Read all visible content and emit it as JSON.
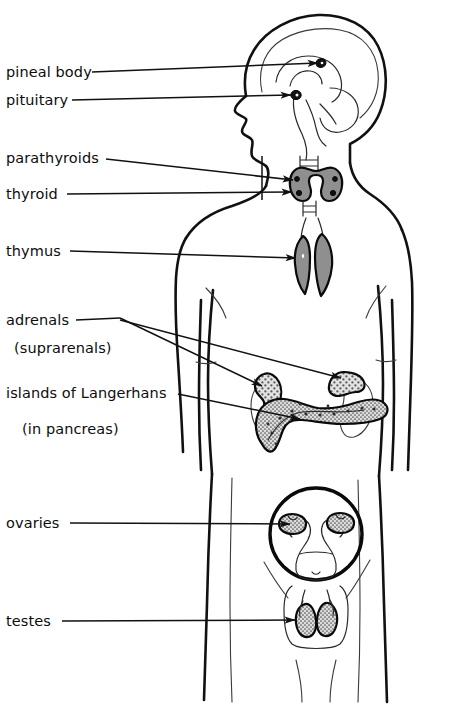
{
  "figure": {
    "background_color": "#ffffff",
    "line_color": "#111111",
    "organ_fill_color": "#8f8f8f",
    "stipple_color": "#6e6e6e"
  },
  "labels": [
    {
      "id": "pineal-body",
      "text": "pineal body",
      "x": 6,
      "y": 77,
      "leader": {
        "x1": 92,
        "y1": 72,
        "x2": 318,
        "y2": 63
      },
      "organ": "pineal body in brain"
    },
    {
      "id": "pituitary",
      "text": "pituitary",
      "x": 6,
      "y": 105,
      "leader": {
        "x1": 72,
        "y1": 100,
        "x2": 293,
        "y2": 95
      },
      "organ": "pituitary gland in brain"
    },
    {
      "id": "parathyroids",
      "text": "parathyroids",
      "x": 6,
      "y": 163,
      "leader": {
        "x1": 106,
        "y1": 159,
        "x2": 293,
        "y2": 179
      },
      "organ": "parathyroid glands on thyroid"
    },
    {
      "id": "thyroid",
      "text": "thyroid",
      "x": 6,
      "y": 199,
      "leader": {
        "x1": 67,
        "y1": 194,
        "x2": 292,
        "y2": 192
      },
      "organ": "thyroid gland in neck"
    },
    {
      "id": "thymus",
      "text": "thymus",
      "x": 6,
      "y": 256,
      "leader": {
        "x1": 70,
        "y1": 251,
        "x2": 295,
        "y2": 247
      },
      "organ": "thymus in upper chest"
    },
    {
      "id": "adrenals",
      "text": "adrenals",
      "x": 6,
      "y": 325,
      "sublabel": "(suprarenals)",
      "sublabel_x": 14,
      "sublabel_y": 353,
      "leader": {
        "x1": 76,
        "y1": 320,
        "x2": 120,
        "y2": 318
      },
      "organ": "adrenal glands on kidneys"
    },
    {
      "id": "islands-of-langerhans",
      "text": "islands of Langerhans",
      "x": 6,
      "y": 398,
      "sublabel": "(in pancreas)",
      "sublabel_x": 22,
      "sublabel_y": 434,
      "leader": {
        "x1": 178,
        "y1": 394,
        "x2": 302,
        "y2": 402
      },
      "organ": "pancreatic islets"
    },
    {
      "id": "ovaries",
      "text": "ovaries",
      "x": 6,
      "y": 528,
      "leader": {
        "x1": 70,
        "y1": 523,
        "x2": 296,
        "y2": 523
      },
      "organ": "ovaries in female reproductive inset"
    },
    {
      "id": "testes",
      "text": "testes",
      "x": 6,
      "y": 626,
      "leader": {
        "x1": 62,
        "y1": 621,
        "x2": 296,
        "y2": 621
      },
      "organ": "testes in scrotum inset"
    }
  ],
  "organs": [
    {
      "id": "pineal-body",
      "name": "pineal body",
      "style": "solid-dark"
    },
    {
      "id": "pituitary",
      "name": "pituitary",
      "style": "solid-dark"
    },
    {
      "id": "thyroid",
      "name": "thyroid",
      "style": "gray-fill"
    },
    {
      "id": "parathyroids",
      "name": "parathyroids",
      "style": "small-dots"
    },
    {
      "id": "thymus",
      "name": "thymus",
      "style": "gray-fill"
    },
    {
      "id": "adrenal-left",
      "name": "left adrenal gland",
      "style": "stipple"
    },
    {
      "id": "adrenal-right",
      "name": "right adrenal gland",
      "style": "stipple"
    },
    {
      "id": "pancreas",
      "name": "pancreas",
      "style": "stipple"
    },
    {
      "id": "kidney-left",
      "name": "left kidney",
      "style": "outline"
    },
    {
      "id": "kidney-right",
      "name": "right kidney",
      "style": "outline"
    },
    {
      "id": "uterus",
      "name": "uterus",
      "style": "outline"
    },
    {
      "id": "ovary-left",
      "name": "left ovary",
      "style": "stipple"
    },
    {
      "id": "ovary-right",
      "name": "right ovary",
      "style": "stipple"
    },
    {
      "id": "testis-left",
      "name": "left testis",
      "style": "stipple"
    },
    {
      "id": "testis-right",
      "name": "right testis",
      "style": "stipple"
    }
  ],
  "insets": [
    {
      "id": "female-inset",
      "name": "female reproductive organs inset",
      "cx": 316,
      "cy": 534,
      "r": 46
    },
    {
      "id": "male-inset",
      "name": "male reproductive organs inset",
      "cx": 318,
      "cy": 622
    }
  ]
}
